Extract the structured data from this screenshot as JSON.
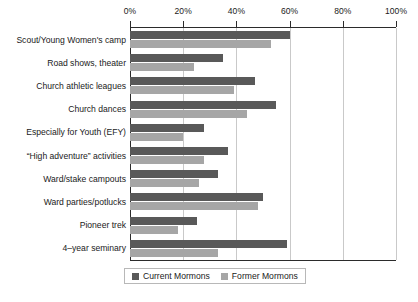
{
  "chart_data": {
    "type": "bar",
    "orientation": "horizontal",
    "title": "",
    "xlabel": "",
    "ylabel": "",
    "xlim": [
      0,
      100
    ],
    "xticks": [
      "0%",
      "20%",
      "40%",
      "60%",
      "80%",
      "100%"
    ],
    "xtick_values": [
      0,
      20,
      40,
      60,
      80,
      100
    ],
    "grid": true,
    "legend_position": "bottom",
    "categories": [
      "Scout/Young Women's camp",
      "Road shows, theater",
      "Church athletic leagues",
      "Church dances",
      "Especially for Youth (EFY)",
      "“High adventure” activities",
      "Ward/stake campouts",
      "Ward parties/potlucks",
      "Pioneer trek",
      "4–year seminary"
    ],
    "series": [
      {
        "name": "Current Mormons",
        "color": "#595959",
        "values": [
          60,
          35,
          47,
          55,
          28,
          37,
          33,
          50,
          25,
          59
        ]
      },
      {
        "name": "Former Mormons",
        "color": "#a6a6a6",
        "values": [
          53,
          24,
          39,
          44,
          20,
          28,
          26,
          48,
          18,
          33
        ]
      }
    ]
  },
  "legend": {
    "entries": [
      {
        "label": "Current Mormons",
        "color": "#595959"
      },
      {
        "label": "Former Mormons",
        "color": "#a6a6a6"
      }
    ]
  }
}
